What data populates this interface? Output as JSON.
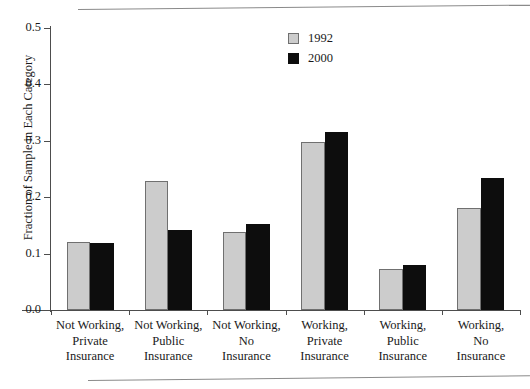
{
  "chart_data": {
    "type": "bar",
    "title": "",
    "xlabel": "",
    "ylabel": "Fraction of Sample in Each Category",
    "ylim": [
      0.0,
      0.5
    ],
    "yticks": [
      "0.0",
      "0.1",
      "0.2",
      "0.3",
      "0.4",
      "0.5"
    ],
    "grid": false,
    "legend_position": "top-center-right",
    "categories": [
      [
        "Not Working,",
        "Private",
        "Insurance"
      ],
      [
        "Not Working,",
        "Public",
        "Insurance"
      ],
      [
        "Not Working,",
        "No",
        "Insurance"
      ],
      [
        "Working,",
        "Private",
        "Insurance"
      ],
      [
        "Working,",
        "Public",
        "Insurance"
      ],
      [
        "Working,",
        "No",
        "Insurance"
      ]
    ],
    "series": [
      {
        "name": "1992",
        "color": "#cccccc",
        "values": [
          0.12,
          0.228,
          0.138,
          0.298,
          0.073,
          0.181
        ]
      },
      {
        "name": "2000",
        "color": "#0d0d0d",
        "values": [
          0.118,
          0.141,
          0.153,
          0.316,
          0.08,
          0.234
        ]
      }
    ]
  }
}
